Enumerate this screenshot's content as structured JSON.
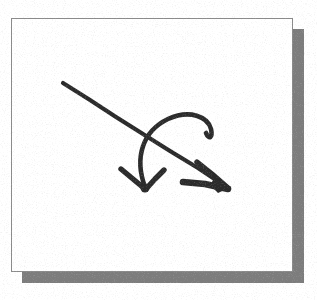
{
  "document": {
    "title": "Scanned arrow sketch",
    "background_color": "#ffffff"
  },
  "card": {
    "name": "white-page",
    "fill_color": "#ffffff",
    "border_color": "#8a8a8a",
    "shadow_color": "#7c7c7c",
    "x": 11,
    "y": 18,
    "width": 282,
    "height": 254,
    "shadow_offset_x": 11,
    "shadow_offset_y": 11
  },
  "drawing": {
    "name": "two-arrow-sketch",
    "ink_color": "#2b2b2b",
    "style": "hand-drawn, scanned halftone",
    "shapes": [
      {
        "name": "straight-arrow",
        "type": "arrow",
        "direction": "down-right",
        "tail_point": [
          51,
          64
        ],
        "tip_point": [
          217,
          170
        ],
        "path": "M51,64 L217,170",
        "head": {
          "type": "open-v",
          "upper_barb": [
            185,
            144
          ],
          "lower_barb": [
            174,
            163
          ]
        }
      },
      {
        "name": "curved-arrow",
        "type": "arrow",
        "direction": "down-left-loop",
        "path": "M132,170 C118,120 178,80 196,106 C205,118 198,120 194,112",
        "tip_point": [
          132,
          170
        ],
        "head": {
          "type": "open-v",
          "left_barb": [
            110,
            152
          ],
          "right_barb": [
            150,
            152
          ]
        }
      }
    ]
  }
}
